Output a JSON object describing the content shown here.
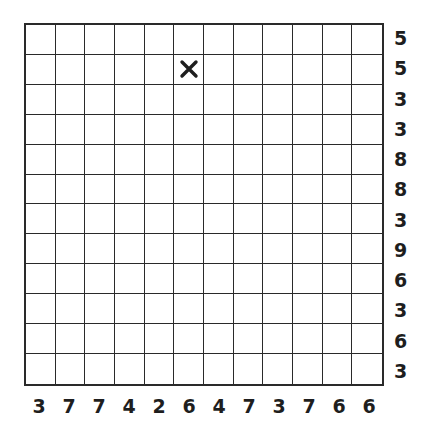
{
  "puzzle": {
    "rows": 12,
    "cols": 12,
    "row_clues": [
      "5",
      "5",
      "3",
      "3",
      "8",
      "8",
      "3",
      "9",
      "6",
      "3",
      "6",
      "3"
    ],
    "col_clues": [
      "3",
      "7",
      "7",
      "4",
      "2",
      "6",
      "4",
      "7",
      "3",
      "7",
      "6",
      "6"
    ],
    "marks": [
      {
        "row": 2,
        "col": 6,
        "type": "x",
        "icon": "x-mark-icon"
      }
    ],
    "colors": {
      "grid_line": "#2a2a2a",
      "clue_text": "#1e1e1e",
      "background": "#ffffff",
      "mark": "#1e1e1e"
    }
  }
}
